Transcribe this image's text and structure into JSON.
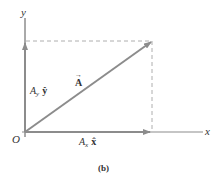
{
  "diagram": {
    "caption": "(b)",
    "axes": {
      "x_label": "x",
      "y_label": "y",
      "origin_label": "O"
    },
    "vector": {
      "symbol": "A",
      "arrow_accent": "→"
    },
    "components": {
      "x": {
        "coef": "A",
        "sub": "x",
        "unit": "x̂"
      },
      "y": {
        "coef": "A",
        "sub": "y",
        "unit": "ŷ"
      }
    },
    "colors": {
      "vector": "#8c8c8c",
      "axes": "#555555",
      "dashed": "#9a9a9a",
      "text": "#333333"
    }
  }
}
